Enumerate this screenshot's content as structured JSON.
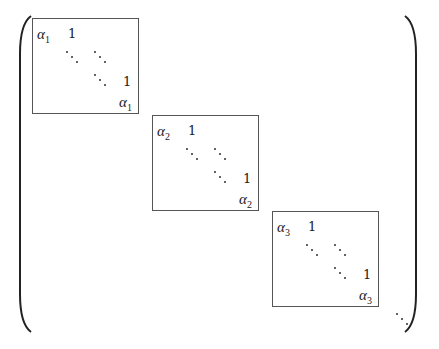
{
  "figure": {
    "blocks": [
      {
        "eigenvalue_symbol": "α",
        "subscript": "1",
        "superdiag": "1",
        "bottom_symbol": "α",
        "bottom_subscript": "1"
      },
      {
        "eigenvalue_symbol": "α",
        "subscript": "2",
        "superdiag": "1",
        "bottom_symbol": "α",
        "bottom_subscript": "2"
      },
      {
        "eigenvalue_symbol": "α",
        "subscript": "3",
        "superdiag": "1",
        "bottom_symbol": "α",
        "bottom_subscript": "3"
      }
    ],
    "trailing": "⋱"
  }
}
